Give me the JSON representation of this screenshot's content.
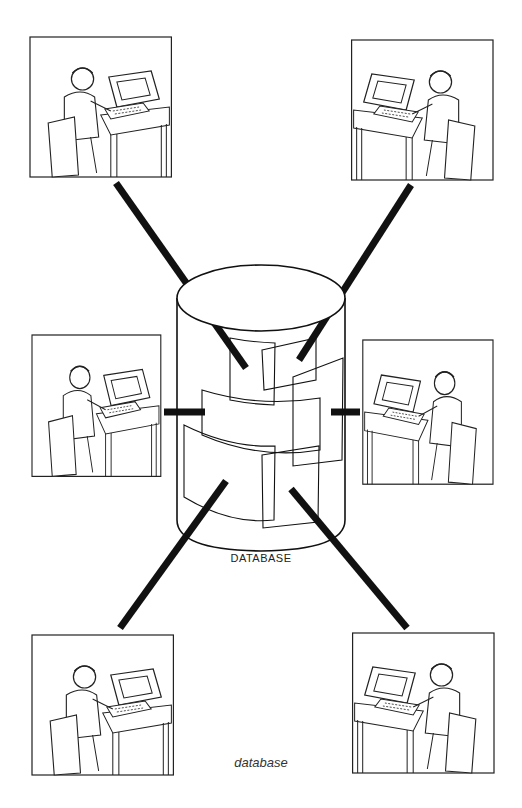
{
  "diagram": {
    "center": {
      "label": "DATABASE",
      "shape": "cylinder-icon"
    },
    "caption": "database",
    "colors": {
      "ink": "#111111",
      "background": "#ffffff"
    },
    "panels": [
      {
        "id": "top-left",
        "scene": "woman typing at terminal"
      },
      {
        "id": "top-right",
        "scene": "girl at terminal with supervisor standing"
      },
      {
        "id": "middle-left",
        "scene": "two people at terminal, plaid shirt"
      },
      {
        "id": "middle-right",
        "scene": "man in striped shirt at terminal"
      },
      {
        "id": "bottom-left",
        "scene": "man standing behind seated user at terminal"
      },
      {
        "id": "bottom-right",
        "scene": "man with glasses at terminal"
      }
    ],
    "connections": [
      {
        "from": "top-left",
        "to": "database"
      },
      {
        "from": "top-right",
        "to": "database"
      },
      {
        "from": "middle-left",
        "to": "database"
      },
      {
        "from": "middle-right",
        "to": "database"
      },
      {
        "from": "bottom-left",
        "to": "database"
      },
      {
        "from": "bottom-right",
        "to": "database"
      }
    ]
  }
}
